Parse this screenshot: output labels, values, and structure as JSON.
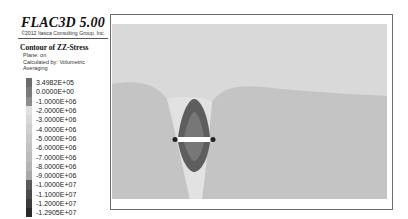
{
  "header": {
    "app_title": "FLAC3D 5.00",
    "copyright": "©2012 Itasca Consulting Group, Inc."
  },
  "contour": {
    "title": "Contour of ZZ-Stress",
    "plane": "Plane: on",
    "calc": "Calculated by: Volumetric Averaging"
  },
  "legend": {
    "entries": [
      {
        "label": "3.4982E+05",
        "color": "#6c6c6c"
      },
      {
        "label": "0.0000E+00",
        "color": "#7a7a7a"
      },
      {
        "label": "-1.0000E+06",
        "color": "#8c8c8c"
      },
      {
        "label": "-2.0000E+06",
        "color": "#e0e0e0"
      },
      {
        "label": "-3.0000E+06",
        "color": "#d8d8d8"
      },
      {
        "label": "-4.0000E+06",
        "color": "#cfcfcf"
      },
      {
        "label": "-5.0000E+06",
        "color": "#c8c8c8"
      },
      {
        "label": "-6.0000E+06",
        "color": "#c2c2c2"
      },
      {
        "label": "-7.0000E+06",
        "color": "#bcbcbc"
      },
      {
        "label": "-8.0000E+06",
        "color": "#b4b4b4"
      },
      {
        "label": "-9.0000E+06",
        "color": "#a8a8a8"
      },
      {
        "label": "-1.0000E+07",
        "color": "#5a5a5a"
      },
      {
        "label": "-1.1000E+07",
        "color": "#4a4a4a"
      },
      {
        "label": "-1.2000E+07",
        "color": "#3a3a3a"
      },
      {
        "label": "-1.2905E+07",
        "color": "#2a2a2a"
      }
    ]
  },
  "plot": {
    "background_color": "#d9d9d9",
    "lower_band_color": "#c4c4c4",
    "inner_zone_color": "#5e5e5e",
    "core_color": "#7a7a7a",
    "light_zone_color": "#e4e4e4"
  }
}
